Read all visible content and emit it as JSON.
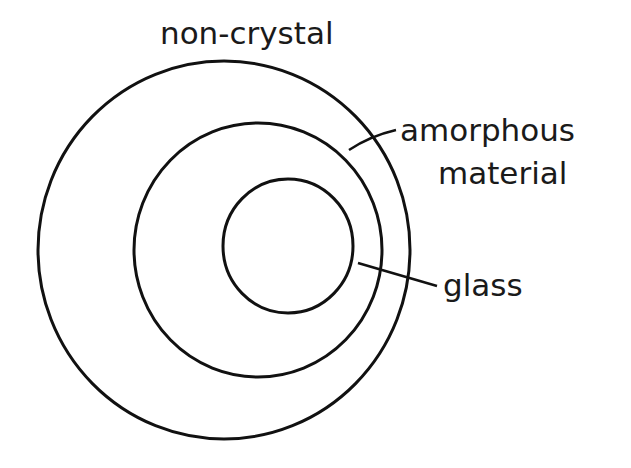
{
  "diagram": {
    "type": "nested-sets",
    "stroke_color": "#111111",
    "background": "#ffffff",
    "labels": {
      "outer": "non-crystal",
      "middle_line1": "amorphous",
      "middle_line2": "material",
      "inner": "glass"
    },
    "sets": [
      {
        "name": "non-crystal",
        "level": "outer"
      },
      {
        "name": "amorphous material",
        "level": "middle"
      },
      {
        "name": "glass",
        "level": "inner"
      }
    ]
  }
}
